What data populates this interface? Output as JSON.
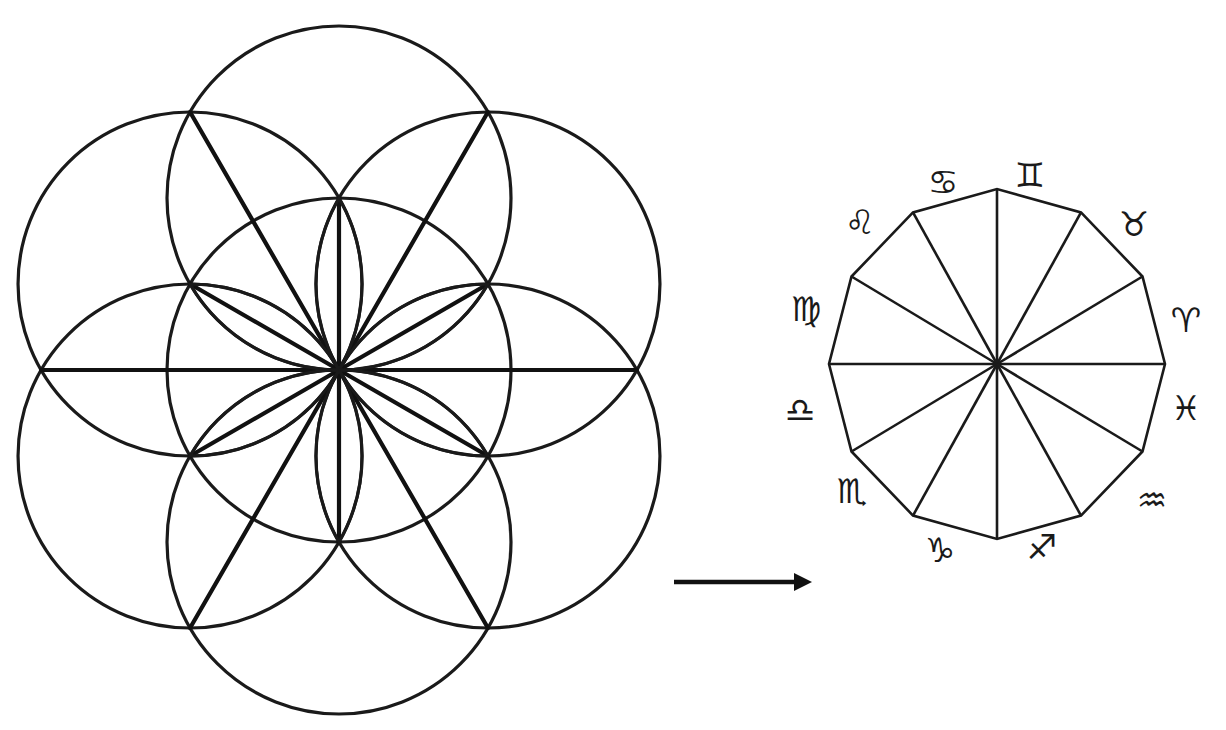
{
  "figure": {
    "left_diagram": {
      "name": "Seed of Life with 12 radiating lines",
      "center": [
        339,
        370
      ],
      "circle_radius": 172,
      "circle_count": 7,
      "stroke_color": "#1a1a1a"
    },
    "arrow": {
      "direction": "right",
      "from": [
        674,
        582
      ],
      "to": [
        812,
        582
      ]
    },
    "right_diagram": {
      "name": "Dodecagon zodiac wheel",
      "center": [
        997,
        364
      ],
      "rx": 168,
      "ry": 175,
      "sides": 12,
      "stroke_color": "#1a1a1a",
      "zodiac_signs": [
        {
          "name": "aries",
          "glyph": "♈",
          "pos": [
            1186,
            320
          ]
        },
        {
          "name": "taurus",
          "glyph": "♉",
          "pos": [
            1134,
            224
          ]
        },
        {
          "name": "gemini",
          "glyph": "♊",
          "pos": [
            1030,
            175
          ]
        },
        {
          "name": "cancer",
          "glyph": "♋",
          "pos": [
            943,
            182
          ]
        },
        {
          "name": "leo",
          "glyph": "♌",
          "pos": [
            860,
            222
          ]
        },
        {
          "name": "virgo",
          "glyph": "♍",
          "pos": [
            806,
            309
          ]
        },
        {
          "name": "libra",
          "glyph": "♎",
          "pos": [
            800,
            410
          ]
        },
        {
          "name": "scorpio",
          "glyph": "♏",
          "pos": [
            852,
            491
          ]
        },
        {
          "name": "capricorn",
          "glyph": "♑",
          "pos": [
            940,
            550
          ]
        },
        {
          "name": "sagittarius",
          "glyph": "♐",
          "pos": [
            1042,
            547
          ]
        },
        {
          "name": "aquarius",
          "glyph": "♒",
          "pos": [
            1152,
            500
          ]
        },
        {
          "name": "pisces",
          "glyph": "♓",
          "pos": [
            1186,
            408
          ]
        }
      ]
    },
    "caption": ""
  }
}
